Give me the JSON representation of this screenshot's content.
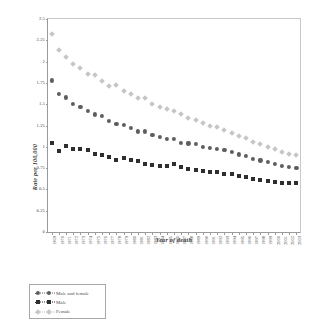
{
  "chart_data": {
    "type": "scatter",
    "title": "",
    "xlabel": "Year of death",
    "ylabel": "Rate per 100,000",
    "xlim": [
      1968.5,
      2003.5
    ],
    "ylim": [
      0,
      2.5
    ],
    "ytick_labels": [
      "0",
      "0.25",
      "0.5",
      "0.75",
      "1",
      "1.25",
      "1.5",
      "1.75",
      "2",
      "2.25",
      "2.5"
    ],
    "ytick_values": [
      0,
      0.25,
      0.5,
      0.75,
      1,
      1.25,
      1.5,
      1.75,
      2,
      2.25,
      2.5
    ],
    "grid": false,
    "legend_position": "below-left",
    "categories": [
      "1969",
      "1970",
      "1971",
      "1972",
      "1973",
      "1974",
      "1975",
      "1976",
      "1977",
      "1978",
      "1979",
      "1980",
      "1981",
      "1982",
      "1983",
      "1984",
      "1985",
      "1986",
      "1987",
      "1988",
      "1989",
      "1990",
      "1991",
      "1992",
      "1993",
      "1994",
      "1995",
      "1996",
      "1997",
      "1998",
      "1999",
      "2000",
      "2001",
      "2002",
      "2003"
    ],
    "series": [
      {
        "name": "Male and female",
        "marker": "circle",
        "color": "#5e5e5e",
        "values": [
          1.78,
          1.62,
          1.58,
          1.5,
          1.47,
          1.42,
          1.38,
          1.36,
          1.3,
          1.27,
          1.26,
          1.22,
          1.18,
          1.18,
          1.14,
          1.12,
          1.09,
          1.09,
          1.05,
          1.04,
          1.03,
          1.0,
          0.99,
          0.98,
          0.96,
          0.94,
          0.91,
          0.89,
          0.86,
          0.84,
          0.82,
          0.8,
          0.78,
          0.76,
          0.75
        ]
      },
      {
        "name": "Male",
        "marker": "square",
        "color": "#2e2e2e",
        "values": [
          1.04,
          0.95,
          1.01,
          0.98,
          0.97,
          0.96,
          0.91,
          0.9,
          0.88,
          0.85,
          0.87,
          0.84,
          0.83,
          0.8,
          0.79,
          0.78,
          0.78,
          0.8,
          0.76,
          0.74,
          0.73,
          0.72,
          0.7,
          0.7,
          0.68,
          0.68,
          0.66,
          0.64,
          0.62,
          0.61,
          0.6,
          0.59,
          0.58,
          0.58,
          0.57
        ]
      },
      {
        "name": "Female",
        "marker": "diamond",
        "color": "#c6c6c6",
        "values": [
          2.32,
          2.14,
          2.05,
          1.97,
          1.92,
          1.86,
          1.84,
          1.77,
          1.71,
          1.72,
          1.66,
          1.62,
          1.57,
          1.57,
          1.5,
          1.47,
          1.44,
          1.42,
          1.39,
          1.34,
          1.32,
          1.28,
          1.25,
          1.23,
          1.2,
          1.16,
          1.13,
          1.1,
          1.06,
          1.03,
          1.0,
          0.97,
          0.94,
          0.92,
          0.9
        ]
      }
    ]
  }
}
